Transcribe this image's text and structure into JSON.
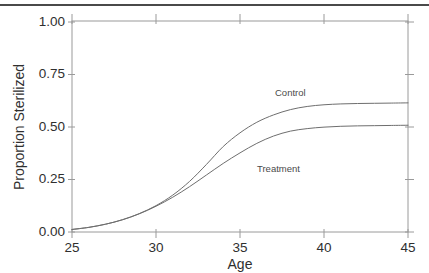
{
  "figure": {
    "background_color": "#ffffff",
    "top_rule_color": "#4a4a4a",
    "axis_color": "#9a9a9a",
    "line_color": "#6e6e6e",
    "text_color": "#2f2f2f"
  },
  "chart_data": {
    "type": "line",
    "title": "",
    "xlabel": "Age",
    "ylabel": "Proportion Sterilized",
    "xlim": [
      25,
      45
    ],
    "ylim": [
      0.0,
      1.0
    ],
    "xticks": [
      25,
      30,
      35,
      40,
      45
    ],
    "xtick_labels": [
      "25",
      "30",
      "35",
      "40",
      "45"
    ],
    "yticks": [
      0.0,
      0.25,
      0.5,
      0.75,
      1.0
    ],
    "ytick_labels": [
      "0.00",
      "0.25",
      "0.50",
      "0.75",
      "1.00"
    ],
    "grid": false,
    "legend": "inline-annotations",
    "annotations": [
      {
        "text": "Control",
        "x": 37.0,
        "y": 0.7
      },
      {
        "text": "Treatment",
        "x": 36.0,
        "y": 0.3
      }
    ],
    "x": [
      25,
      26,
      27,
      28,
      29,
      30,
      31,
      32,
      33,
      34,
      35,
      36,
      37,
      38,
      39,
      40,
      41,
      42,
      43,
      44,
      45
    ],
    "series": [
      {
        "name": "Control",
        "values": [
          0.012,
          0.022,
          0.037,
          0.058,
          0.087,
          0.125,
          0.175,
          0.24,
          0.32,
          0.405,
          0.47,
          0.52,
          0.555,
          0.58,
          0.595,
          0.603,
          0.607,
          0.609,
          0.61,
          0.611,
          0.612
        ]
      },
      {
        "name": "Treatment",
        "values": [
          0.012,
          0.022,
          0.037,
          0.058,
          0.086,
          0.122,
          0.165,
          0.215,
          0.27,
          0.325,
          0.375,
          0.42,
          0.455,
          0.478,
          0.49,
          0.497,
          0.501,
          0.503,
          0.504,
          0.505,
          0.506
        ]
      }
    ]
  }
}
